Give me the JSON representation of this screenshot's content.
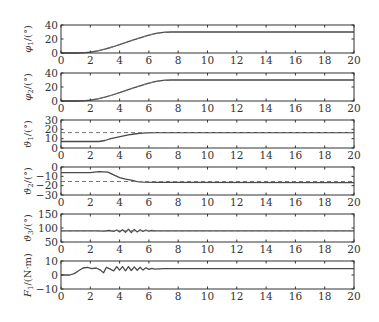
{
  "chart_data": [
    {
      "type": "line",
      "ylabel": "φ1/(°)",
      "ylabel_main": "φ",
      "ylabel_sub": "1",
      "ylabel_unit": "/(°)",
      "xlim": [
        0,
        20
      ],
      "ylim": [
        0,
        40
      ],
      "xticks": [
        0,
        2,
        4,
        6,
        8,
        10,
        12,
        14,
        16,
        18,
        20
      ],
      "yticks": [
        0,
        20,
        40
      ],
      "series": [
        {
          "name": "actual",
          "style": "solid",
          "x": [
            0,
            1,
            1.5,
            2,
            2.5,
            3,
            3.5,
            4,
            4.5,
            5,
            5.5,
            6,
            6.5,
            7,
            7.5,
            8,
            20
          ],
          "y": [
            0,
            0,
            0.3,
            1.2,
            3,
            5.5,
            8.5,
            12,
            15.5,
            19,
            22.5,
            25.5,
            28,
            29.5,
            30,
            30,
            30
          ]
        },
        {
          "name": "reference",
          "style": "dashed",
          "x": [
            0,
            1,
            1.5,
            2,
            2.5,
            3,
            3.5,
            4,
            4.5,
            5,
            5.5,
            6,
            6.5,
            7,
            7.5,
            8,
            20
          ],
          "y": [
            0,
            0,
            0.3,
            1.2,
            3,
            5.5,
            8.5,
            12,
            15.5,
            19,
            22.5,
            25.5,
            28,
            29.5,
            30,
            30,
            30
          ]
        }
      ]
    },
    {
      "type": "line",
      "ylabel": "φ2/(°)",
      "ylabel_main": "φ",
      "ylabel_sub": "2",
      "ylabel_unit": "/(°)",
      "xlim": [
        0,
        20
      ],
      "ylim": [
        0,
        40
      ],
      "xticks": [
        0,
        2,
        4,
        6,
        8,
        10,
        12,
        14,
        16,
        18,
        20
      ],
      "yticks": [
        0,
        20,
        40
      ],
      "series": [
        {
          "name": "actual",
          "style": "solid",
          "x": [
            0,
            1,
            1.5,
            2,
            2.5,
            3,
            3.5,
            4,
            4.5,
            5,
            5.5,
            6,
            6.5,
            7,
            7.5,
            8,
            20
          ],
          "y": [
            0,
            0,
            0.3,
            1.2,
            3,
            5.5,
            8.5,
            12,
            15.5,
            19,
            22.5,
            25.5,
            28,
            29.5,
            30,
            30,
            30
          ]
        },
        {
          "name": "reference",
          "style": "dashed",
          "x": [
            0,
            1,
            1.5,
            2,
            2.5,
            3,
            3.5,
            4,
            4.5,
            5,
            5.5,
            6,
            6.5,
            7,
            7.5,
            8,
            20
          ],
          "y": [
            0,
            0,
            0.3,
            1.2,
            3,
            5.5,
            8.5,
            12,
            15.5,
            19,
            22.5,
            25.5,
            28,
            29.5,
            30,
            30,
            30
          ]
        }
      ]
    },
    {
      "type": "line",
      "ylabel": "ϑ1/(°)",
      "ylabel_main": "ϑ",
      "ylabel_sub": "1",
      "ylabel_unit": "/(°)",
      "xlim": [
        0,
        20
      ],
      "ylim": [
        0,
        30
      ],
      "xticks": [
        0,
        2,
        4,
        6,
        8,
        10,
        12,
        14,
        16,
        18,
        20
      ],
      "yticks": [
        0,
        10,
        20,
        30
      ],
      "series": [
        {
          "name": "actual",
          "style": "solid",
          "x": [
            0,
            2.6,
            3.0,
            3.4,
            3.8,
            4.2,
            4.6,
            5.0,
            5.4,
            5.8,
            6.5,
            20
          ],
          "y": [
            7,
            7,
            8,
            10,
            11.5,
            12.8,
            14,
            15,
            15.8,
            16.2,
            16.5,
            16.5
          ]
        },
        {
          "name": "reference",
          "style": "dashed",
          "x": [
            0,
            20
          ],
          "y": [
            16.5,
            16.5
          ]
        }
      ]
    },
    {
      "type": "line",
      "ylabel": "ϑ2/(°)",
      "ylabel_main": "ϑ",
      "ylabel_sub": "2",
      "ylabel_unit": "/(°)",
      "xlim": [
        0,
        20
      ],
      "ylim": [
        -30,
        0
      ],
      "xticks": [
        0,
        2,
        4,
        6,
        8,
        10,
        12,
        14,
        16,
        18,
        20
      ],
      "yticks": [
        0,
        -10,
        -20,
        -30
      ],
      "series": [
        {
          "name": "actual",
          "style": "solid",
          "x": [
            0,
            2.0,
            2.6,
            3.2,
            3.6,
            4.0,
            4.4,
            4.8,
            5.2,
            5.6,
            6.5,
            20
          ],
          "y": [
            -6,
            -6,
            -5,
            -5.5,
            -8.5,
            -11.5,
            -13,
            -14,
            -15.8,
            -16.3,
            -16.5,
            -16.8
          ]
        },
        {
          "name": "reference",
          "style": "dashed",
          "x": [
            0,
            20
          ],
          "y": [
            -15.5,
            -15.5
          ]
        }
      ]
    },
    {
      "type": "line",
      "ylabel": "ϑ3/(°)",
      "ylabel_main": "ϑ",
      "ylabel_sub": "3",
      "ylabel_unit": "/(°)",
      "xlim": [
        0,
        20
      ],
      "ylim": [
        50,
        150
      ],
      "xticks": [
        0,
        2,
        4,
        6,
        8,
        10,
        12,
        14,
        16,
        18,
        20
      ],
      "yticks": [
        50,
        100,
        150
      ],
      "series": [
        {
          "name": "actual",
          "style": "solid",
          "x": [
            0,
            2.5,
            2.9,
            3.3,
            3.6,
            3.8,
            4.0,
            4.2,
            4.4,
            4.6,
            4.8,
            5.0,
            5.2,
            5.4,
            5.6,
            5.8,
            6.0,
            6.2,
            6.5,
            7,
            20
          ],
          "y": [
            90,
            90,
            89,
            91,
            88,
            93,
            86,
            94,
            85,
            96,
            84,
            95,
            86,
            94,
            88,
            93,
            89,
            91,
            90,
            90,
            90
          ]
        },
        {
          "name": "reference",
          "style": "dashed",
          "x": [
            0,
            20
          ],
          "y": [
            90,
            90
          ]
        }
      ]
    },
    {
      "type": "line",
      "ylabel": "F1/(N·m)",
      "ylabel_main": "F",
      "ylabel_sub": "1",
      "ylabel_unit": "/(N·m)",
      "xlim": [
        0,
        20
      ],
      "ylim": [
        -10,
        10
      ],
      "xticks": [
        0,
        2,
        4,
        6,
        8,
        10,
        12,
        14,
        16,
        18,
        20
      ],
      "yticks": [
        10,
        0,
        -10
      ],
      "series": [
        {
          "name": "actual",
          "style": "solid",
          "x": [
            0,
            0.6,
            0.9,
            1.2,
            1.5,
            1.8,
            2.1,
            2.4,
            2.7,
            2.9,
            3.1,
            3.3,
            3.6,
            3.8,
            4.0,
            4.2,
            4.4,
            4.6,
            4.8,
            5.0,
            5.2,
            5.4,
            5.6,
            5.8,
            6.0,
            6.2,
            6.4,
            7.0,
            20
          ],
          "y": [
            0,
            0,
            1,
            3,
            5,
            5.5,
            4.5,
            5,
            3.5,
            1.5,
            5.5,
            4.5,
            3,
            6,
            3.5,
            6,
            3,
            6,
            3.2,
            5.8,
            3.4,
            5.5,
            3.5,
            5.2,
            4,
            4.8,
            4.2,
            4.5,
            4.5
          ]
        }
      ]
    }
  ],
  "style": {
    "frame_color": "#333333",
    "line_color": "#4a4a4a",
    "dash_color": "#777777",
    "background": "#ffffff"
  }
}
